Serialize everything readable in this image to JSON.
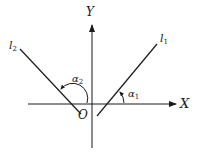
{
  "diagram": {
    "type": "angle-of-inclination",
    "axes": {
      "x_label": "X",
      "y_label": "Y",
      "origin_label": "O"
    },
    "lines": [
      {
        "name": "l",
        "subscript": "1",
        "angle_symbol": "α",
        "angle_subscript": "1",
        "description": "positive slope, acute inclination angle"
      },
      {
        "name": "l",
        "subscript": "2",
        "angle_symbol": "α",
        "angle_subscript": "2",
        "description": "negative slope, obtuse inclination angle"
      }
    ],
    "colors": {
      "stroke": "#1a1a1a",
      "background": "#ffffff"
    }
  }
}
